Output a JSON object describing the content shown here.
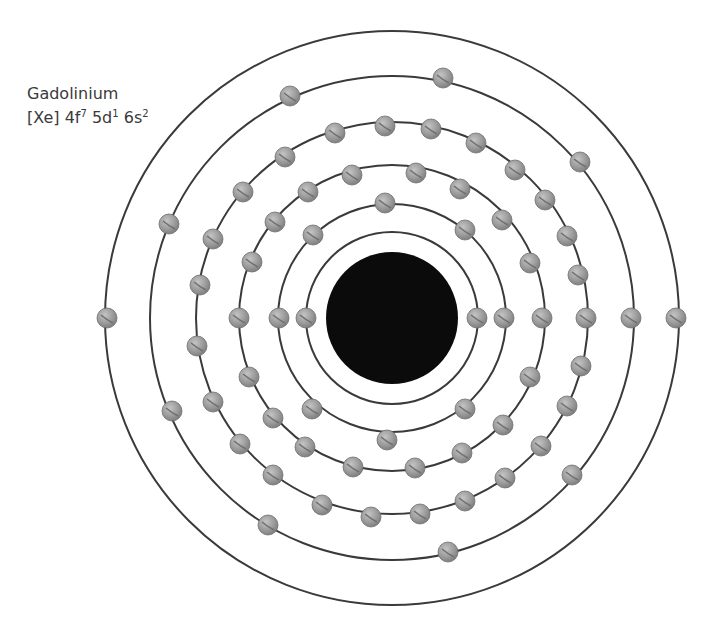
{
  "element": {
    "name": "Gadolinium",
    "config_parts": [
      {
        "text": "[Xe] 4f",
        "sup": "7"
      },
      {
        "text": " 5d",
        "sup": "1"
      },
      {
        "text": " 6s",
        "sup": "2"
      }
    ]
  },
  "colors": {
    "shell_stroke": "#3a3a3a",
    "nucleus": "#0b0b0b",
    "electron_fill": "#9a9a9a",
    "electron_stroke": "#6e6e6e",
    "background": "#ffffff"
  },
  "atom": {
    "center": [
      392,
      318
    ],
    "nucleus_radius": 66,
    "electron_radius": 10,
    "shells": [
      {
        "radius": 86,
        "electron_count": 2,
        "electrons": [
          [
            306,
            318
          ],
          [
            477,
            318
          ]
        ]
      },
      {
        "radius": 114,
        "electron_count": 8,
        "electrons": [
          [
            385,
            203
          ],
          [
            465,
            230
          ],
          [
            504,
            318
          ],
          [
            465,
            409
          ],
          [
            387,
            440
          ],
          [
            312,
            409
          ],
          [
            279,
            318
          ],
          [
            313,
            235
          ]
        ]
      },
      {
        "radius": 153,
        "electron_count": 18,
        "electrons": [
          [
            352,
            175
          ],
          [
            416,
            173
          ],
          [
            460,
            189
          ],
          [
            502,
            220
          ],
          [
            530,
            263
          ],
          [
            542,
            318
          ],
          [
            530,
            377
          ],
          [
            503,
            425
          ],
          [
            462,
            453
          ],
          [
            415,
            468
          ],
          [
            353,
            467
          ],
          [
            305,
            447
          ],
          [
            273,
            418
          ],
          [
            249,
            377
          ],
          [
            239,
            318
          ],
          [
            252,
            262
          ],
          [
            275,
            222
          ],
          [
            308,
            192
          ]
        ]
      },
      {
        "radius": 196,
        "electron_count": 25,
        "electrons": [
          [
            335,
            133
          ],
          [
            385,
            126
          ],
          [
            431,
            129
          ],
          [
            476,
            143
          ],
          [
            515,
            170
          ],
          [
            545,
            200
          ],
          [
            567,
            236
          ],
          [
            578,
            275
          ],
          [
            586,
            318
          ],
          [
            581,
            366
          ],
          [
            567,
            406
          ],
          [
            541,
            446
          ],
          [
            505,
            478
          ],
          [
            465,
            501
          ],
          [
            420,
            514
          ],
          [
            371,
            517
          ],
          [
            322,
            505
          ],
          [
            273,
            475
          ],
          [
            240,
            444
          ],
          [
            213,
            402
          ],
          [
            197,
            346
          ],
          [
            200,
            285
          ],
          [
            213,
            239
          ],
          [
            243,
            192
          ],
          [
            285,
            157
          ]
        ]
      },
      {
        "radius": 242,
        "electron_count": 9,
        "electrons": [
          [
            443,
            78
          ],
          [
            580,
            162
          ],
          [
            631,
            318
          ],
          [
            572,
            475
          ],
          [
            448,
            552
          ],
          [
            268,
            525
          ],
          [
            172,
            411
          ],
          [
            169,
            224
          ],
          [
            290,
            96
          ]
        ]
      },
      {
        "radius": 287,
        "electron_count": 2,
        "electrons": [
          [
            107,
            318
          ],
          [
            676,
            318
          ]
        ]
      }
    ]
  }
}
